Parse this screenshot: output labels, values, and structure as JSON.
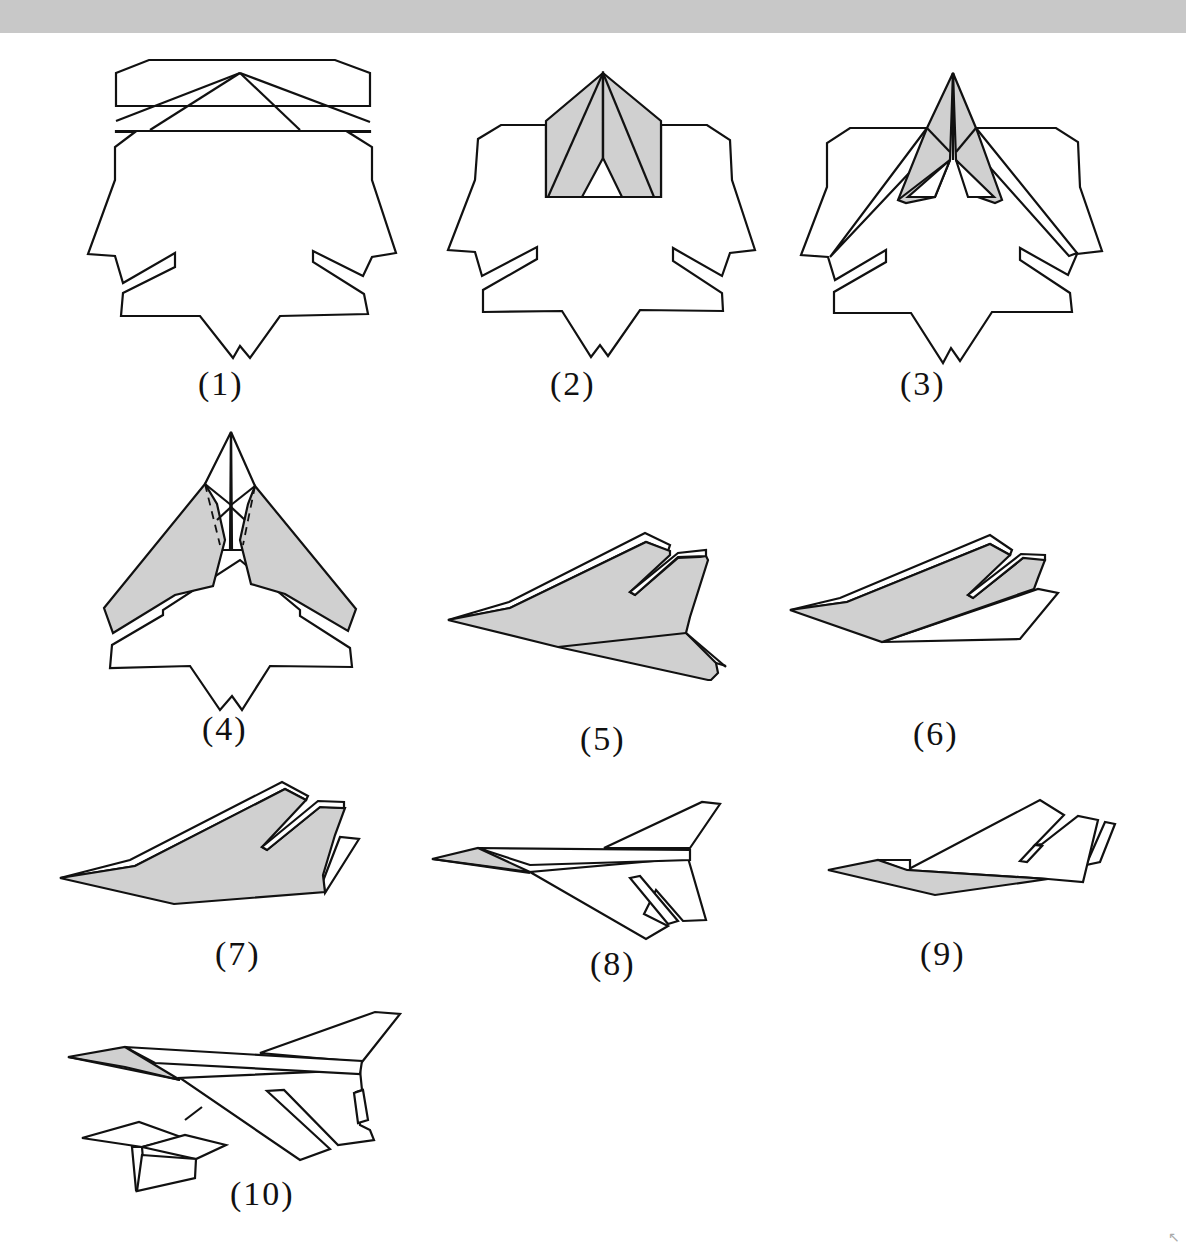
{
  "figure": {
    "shading_color": "#d0d0d0",
    "line_color": "#111111",
    "header_bar_color": "#c8c8c8"
  },
  "steps": [
    {
      "number": 1,
      "label": "(1)",
      "view": "flat sheet, fold lines shown"
    },
    {
      "number": 2,
      "label": "(2)",
      "view": "nose flaps folded (shaded)"
    },
    {
      "number": 3,
      "label": "(3)",
      "view": "flaps folded to center"
    },
    {
      "number": 4,
      "label": "(4)",
      "view": "wings folded along dashed lines"
    },
    {
      "number": 5,
      "label": "(5)",
      "view": "side view, folded in half"
    },
    {
      "number": 6,
      "label": "(6)",
      "view": "side view, wing lowered"
    },
    {
      "number": 7,
      "label": "(7)",
      "view": "side view, tail fold"
    },
    {
      "number": 8,
      "label": "(8)",
      "view": "wings spread"
    },
    {
      "number": 9,
      "label": "(9)",
      "view": "alternate side view"
    },
    {
      "number": 10,
      "label": "(10)",
      "view": "finished plane with tail detail"
    }
  ],
  "corner_icon": "↖"
}
